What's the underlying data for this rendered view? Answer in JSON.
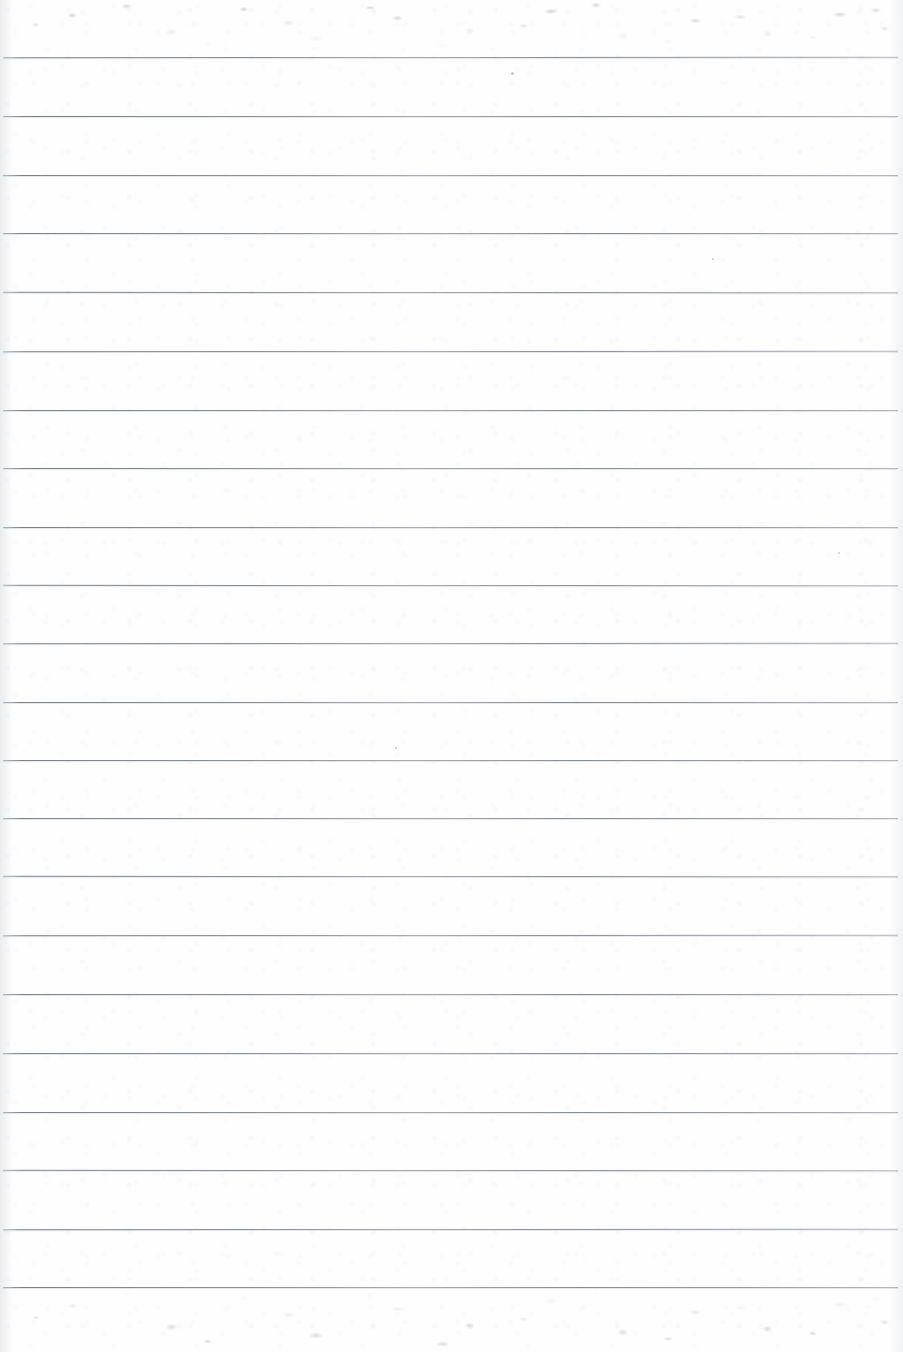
{
  "document": {
    "kind": "scanned-lined-paper",
    "title": "Blank lined notebook page",
    "width": 903,
    "height": 1352,
    "visible_text": "",
    "handwriting": "none",
    "printed_text": "none"
  },
  "colors": {
    "paper": "#fefefe",
    "rule_line": "#7a7e89",
    "scan_noise": "#9a9da5",
    "edge_shadow": "#b0b4bc"
  },
  "ruling": {
    "line_count": 21,
    "first_line_y": 57,
    "line_spacing": 58.6,
    "line_left_x": 3,
    "line_right_x": 898,
    "line_thickness": 1,
    "line_ys": [
      57,
      116,
      175,
      233,
      292,
      351,
      410,
      468,
      527,
      585,
      643,
      702,
      760,
      818,
      876,
      935,
      994,
      1053,
      1112,
      1170,
      1229,
      1287
    ]
  },
  "margins": {
    "top_blank_height": 57,
    "bottom_blank_height": 65,
    "left_edge_band": 12,
    "right_edge_band": 14
  },
  "artifacts": {
    "top_noise_band": {
      "y": 0,
      "height": 52,
      "label": "scanner-edge-noise"
    },
    "bottom_noise_band": {
      "y": 1286,
      "height": 66,
      "label": "scanner-edge-noise"
    },
    "specks": [
      {
        "x": 511,
        "y": 72,
        "size": 3
      },
      {
        "x": 395,
        "y": 747,
        "size": 2
      },
      {
        "x": 712,
        "y": 258,
        "size": 2
      },
      {
        "x": 838,
        "y": 552,
        "size": 2
      }
    ]
  }
}
